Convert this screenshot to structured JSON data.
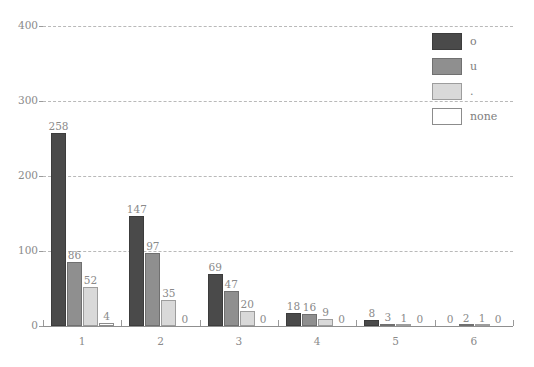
{
  "chart_data": {
    "type": "bar",
    "title": "",
    "xlabel": "",
    "ylabel": "",
    "categories": [
      "1",
      "2",
      "3",
      "4",
      "5",
      "6"
    ],
    "series": [
      {
        "name": "o",
        "color": "#4a4a4a",
        "values": [
          258,
          147,
          69,
          18,
          8,
          0
        ]
      },
      {
        "name": "u",
        "color": "#8f8f8f",
        "values": [
          86,
          97,
          47,
          16,
          3,
          2
        ]
      },
      {
        "name": ".",
        "color": "#d9d9d9",
        "values": [
          52,
          35,
          20,
          9,
          1,
          1
        ]
      },
      {
        "name": "none",
        "color": "#ffffff",
        "values": [
          4,
          0,
          0,
          0,
          0,
          0
        ]
      }
    ],
    "ylim": [
      0,
      400
    ],
    "yticks": [
      0,
      100,
      200,
      300,
      400
    ],
    "ytick_labels": [
      "0",
      "100",
      "200",
      "300",
      "400"
    ],
    "grid": true,
    "grid_color": "#b9b9b9",
    "grid_style": "dashed",
    "legend_position": "top-right",
    "value_labels": true,
    "background": "#ffffff",
    "axis_color": "#8f8f8f",
    "text_color": "#8a8a8a"
  },
  "legend": {
    "entries": [
      {
        "label": "o"
      },
      {
        "label": "u"
      },
      {
        "label": "."
      },
      {
        "label": "none"
      }
    ]
  }
}
